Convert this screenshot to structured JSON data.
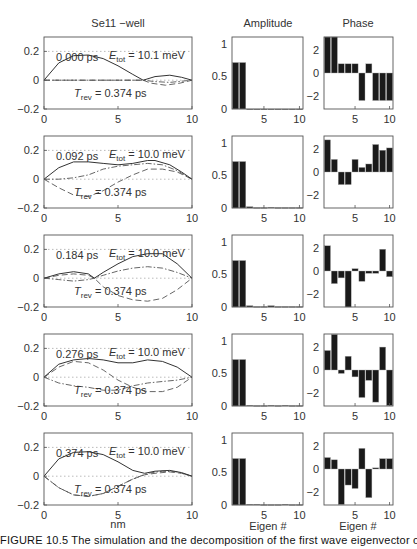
{
  "figure": {
    "column_titles": {
      "wave": "Se11 −well",
      "amplitude": "Amplitude",
      "phase": "Phase"
    },
    "x_labels": {
      "wave": "nm",
      "amplitude": "Eigen #",
      "phase": "Eigen #"
    },
    "caption": "FIGURE 10.5  The simulation and the decomposition of the first wave eigenvector of"
  },
  "chart_data": [
    {
      "type": "line",
      "title": "Se11 −well",
      "xlabel": "nm",
      "ylabel": "",
      "xlim": [
        0,
        10
      ],
      "ylim": [
        -0.2,
        0.3
      ],
      "xticks": [
        0,
        5,
        10
      ],
      "yticks": [
        -0.2,
        0,
        0.2
      ],
      "grid": "dotted at y=0.2 and y=0",
      "series_styles": [
        "solid (magnitude)",
        "dashed (real)",
        "dash-dot (imag)"
      ],
      "panels": [
        {
          "time": "0.000  ps",
          "E_tot": "= 10.1 meV",
          "T_rev": "= 0.374 ps",
          "solid": [
            [
              0,
              0
            ],
            [
              1,
              0.12
            ],
            [
              2,
              0.17
            ],
            [
              3,
              0.175
            ],
            [
              4,
              0.15
            ],
            [
              5,
              0.1
            ],
            [
              6,
              0.04
            ],
            [
              6.7,
              0.0
            ],
            [
              7.5,
              0.025
            ],
            [
              8.5,
              0.035
            ],
            [
              9.3,
              0.02
            ],
            [
              10,
              0
            ]
          ],
          "dashed": [
            [
              0,
              0
            ],
            [
              6.7,
              0
            ],
            [
              7.2,
              -0.02
            ],
            [
              8.2,
              -0.035
            ],
            [
              9.2,
              -0.02
            ],
            [
              10,
              0
            ]
          ],
          "dashdot": [
            [
              0,
              0
            ],
            [
              6.7,
              0
            ],
            [
              7.5,
              -0.01
            ],
            [
              8.5,
              -0.015
            ],
            [
              9.5,
              -0.005
            ],
            [
              10,
              0
            ]
          ]
        },
        {
          "time": "0.092  ps",
          "E_tot": "= 10.0 meV",
          "T_rev": "= 0.374 ps",
          "solid": [
            [
              0,
              0
            ],
            [
              1,
              0.08
            ],
            [
              2,
              0.12
            ],
            [
              3,
              0.12
            ],
            [
              4,
              0.11
            ],
            [
              5,
              0.1
            ],
            [
              6,
              0.11
            ],
            [
              7,
              0.13
            ],
            [
              7.5,
              0.13
            ],
            [
              8.5,
              0.1
            ],
            [
              9.3,
              0.05
            ],
            [
              10,
              0
            ]
          ],
          "dashed": [
            [
              0,
              0
            ],
            [
              1,
              -0.06
            ],
            [
              2,
              -0.11
            ],
            [
              3,
              -0.12
            ],
            [
              4,
              -0.08
            ],
            [
              5,
              -0.02
            ],
            [
              6,
              0.03
            ],
            [
              7,
              0.07
            ],
            [
              8,
              0.07
            ],
            [
              9,
              0.05
            ],
            [
              10,
              0
            ]
          ],
          "dashdot": [
            [
              0,
              0
            ],
            [
              1,
              0.0
            ],
            [
              2,
              0.01
            ],
            [
              3,
              0.03
            ],
            [
              4,
              0.07
            ],
            [
              5,
              0.09
            ],
            [
              6,
              0.1
            ],
            [
              7,
              0.11
            ],
            [
              8,
              0.1
            ],
            [
              9,
              0.06
            ],
            [
              10,
              0
            ]
          ]
        },
        {
          "time": "0.184  ps",
          "E_tot": "= 10.0 meV",
          "T_rev": "= 0.374 ps",
          "solid": [
            [
              0,
              0
            ],
            [
              1,
              0.03
            ],
            [
              2,
              0.045
            ],
            [
              3,
              0.03
            ],
            [
              3.4,
              0.0
            ],
            [
              4,
              0.04
            ],
            [
              5,
              0.1
            ],
            [
              6,
              0.15
            ],
            [
              7,
              0.17
            ],
            [
              8,
              0.17
            ],
            [
              9,
              0.1
            ],
            [
              10,
              0
            ]
          ],
          "dashed": [
            [
              0,
              0
            ],
            [
              1,
              0.02
            ],
            [
              2,
              0.03
            ],
            [
              3,
              0.02
            ],
            [
              3.4,
              0.0
            ],
            [
              4,
              -0.06
            ],
            [
              5,
              -0.12
            ],
            [
              6,
              -0.15
            ],
            [
              7,
              -0.16
            ],
            [
              8,
              -0.14
            ],
            [
              9,
              -0.08
            ],
            [
              10,
              0
            ]
          ],
          "dashdot": [
            [
              0,
              0
            ],
            [
              1,
              -0.01
            ],
            [
              2,
              -0.02
            ],
            [
              3,
              -0.01
            ],
            [
              3.4,
              0.0
            ],
            [
              4,
              0.02
            ],
            [
              5,
              0.05
            ],
            [
              6,
              0.07
            ],
            [
              7,
              0.08
            ],
            [
              8,
              0.07
            ],
            [
              9,
              0.04
            ],
            [
              10,
              0
            ]
          ]
        },
        {
          "time": "0.276  ps",
          "E_tot": "= 10.0 meV",
          "T_rev": "= 0.374 ps",
          "solid": [
            [
              0,
              0
            ],
            [
              1,
              0.09
            ],
            [
              2,
              0.12
            ],
            [
              3,
              0.13
            ],
            [
              4,
              0.12
            ],
            [
              5,
              0.1
            ],
            [
              6,
              0.1
            ],
            [
              7,
              0.12
            ],
            [
              8,
              0.11
            ],
            [
              9,
              0.07
            ],
            [
              10,
              0
            ]
          ],
          "dashed": [
            [
              0,
              0
            ],
            [
              1,
              0.07
            ],
            [
              2,
              0.11
            ],
            [
              3,
              0.1
            ],
            [
              4,
              0.05
            ],
            [
              5,
              -0.02
            ],
            [
              6,
              -0.07
            ],
            [
              7,
              -0.1
            ],
            [
              8,
              -0.1
            ],
            [
              9,
              -0.07
            ],
            [
              10,
              0
            ]
          ],
          "dashdot": [
            [
              0,
              0
            ],
            [
              1,
              -0.04
            ],
            [
              2,
              -0.06
            ],
            [
              3,
              -0.07
            ],
            [
              4,
              -0.09
            ],
            [
              5,
              -0.09
            ],
            [
              6,
              -0.06
            ],
            [
              7,
              -0.04
            ],
            [
              8,
              -0.03
            ],
            [
              9,
              -0.02
            ],
            [
              10,
              0
            ]
          ]
        },
        {
          "time": "0.374  ps",
          "E_tot": "= 10.0 meV",
          "T_rev": "= 0.374 ps",
          "solid": [
            [
              0,
              0
            ],
            [
              1,
              0.12
            ],
            [
              2,
              0.165
            ],
            [
              3,
              0.17
            ],
            [
              4,
              0.15
            ],
            [
              5,
              0.1
            ],
            [
              6,
              0.04
            ],
            [
              6.8,
              0.02
            ],
            [
              7.5,
              0.035
            ],
            [
              8.5,
              0.04
            ],
            [
              9.3,
              0.025
            ],
            [
              10,
              0
            ]
          ],
          "dashed": [
            [
              0,
              0
            ],
            [
              1,
              -0.08
            ],
            [
              2,
              -0.13
            ],
            [
              3,
              -0.14
            ],
            [
              4,
              -0.12
            ],
            [
              5,
              -0.07
            ],
            [
              6,
              -0.02
            ],
            [
              6.8,
              0.01
            ],
            [
              7.5,
              0.02
            ],
            [
              8.5,
              0.03
            ],
            [
              9.3,
              0.02
            ],
            [
              10,
              0
            ]
          ],
          "dashdot": [
            [
              0,
              0
            ],
            [
              1,
              -0.08
            ],
            [
              2,
              -0.13
            ],
            [
              3,
              -0.14
            ],
            [
              4,
              -0.12
            ],
            [
              5,
              -0.07
            ],
            [
              6,
              -0.02
            ],
            [
              7,
              0.02
            ],
            [
              8,
              0.035
            ],
            [
              9,
              0.03
            ],
            [
              10,
              0
            ]
          ]
        }
      ]
    },
    {
      "type": "bar",
      "title": "Amplitude",
      "xlabel": "Eigen #",
      "xlim": [
        0.5,
        10.5
      ],
      "ylim": [
        0,
        1.1
      ],
      "xticks": [
        5,
        10
      ],
      "yticks": [
        0,
        0.5,
        1
      ],
      "categories": [
        1,
        2,
        3,
        4,
        5,
        6,
        7,
        8,
        9,
        10
      ],
      "series": [
        {
          "name": "0.000 ps",
          "values": [
            0.71,
            0.71,
            0,
            0,
            0,
            0,
            0,
            0,
            0,
            0
          ]
        },
        {
          "name": "0.092 ps",
          "values": [
            0.71,
            0.71,
            0.02,
            0.005,
            0.005,
            0.01,
            0.005,
            0.005,
            0.005,
            0.005
          ]
        },
        {
          "name": "0.184 ps",
          "values": [
            0.71,
            0.71,
            0.02,
            0.005,
            0.005,
            0.02,
            0.005,
            0.005,
            0.005,
            0.005
          ]
        },
        {
          "name": "0.276 ps",
          "values": [
            0.71,
            0.71,
            0.01,
            0.005,
            0.005,
            0.01,
            0.005,
            0.01,
            0.005,
            0.005
          ]
        },
        {
          "name": "0.374 ps",
          "values": [
            0.71,
            0.71,
            0.01,
            0.01,
            0.005,
            0.005,
            0.005,
            0.01,
            0.005,
            0.005
          ]
        }
      ]
    },
    {
      "type": "bar",
      "title": "Phase",
      "xlabel": "Eigen #",
      "xlim": [
        0.5,
        10.5
      ],
      "ylim": [
        -3.14,
        3.14
      ],
      "xticks": [
        5,
        10
      ],
      "yticks": [
        -2,
        0,
        2
      ],
      "categories": [
        1,
        2,
        3,
        4,
        5,
        6,
        7,
        8,
        9,
        10
      ],
      "series": [
        {
          "name": "0.000 ps",
          "values": [
            3.14,
            3.14,
            0.8,
            0.8,
            0.8,
            -2.4,
            0.8,
            -2.4,
            -2.4,
            -2.4
          ]
        },
        {
          "name": "0.092 ps",
          "values": [
            2.8,
            1.1,
            -1.1,
            -1.1,
            1.1,
            0.4,
            0.7,
            2.4,
            1.9,
            2.1
          ]
        },
        {
          "name": "0.184 ps",
          "values": [
            2.2,
            -1.1,
            -0.6,
            -3.14,
            0.2,
            -0.9,
            -0.2,
            -0.2,
            1.9,
            -0.5
          ]
        },
        {
          "name": "0.276 ps",
          "values": [
            1.7,
            3.1,
            -0.3,
            1.2,
            -0.6,
            -2.4,
            -0.9,
            -2.8,
            2.0,
            -3.1
          ]
        },
        {
          "name": "0.374 ps",
          "values": [
            1.0,
            0.8,
            -3.1,
            -1.4,
            -1.7,
            1.8,
            -2.5,
            0.1,
            0.9,
            0.9
          ]
        }
      ]
    }
  ]
}
